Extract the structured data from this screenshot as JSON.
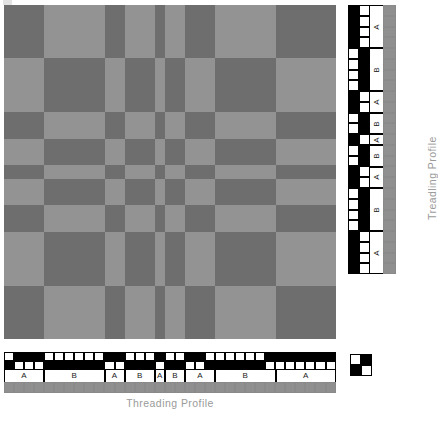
{
  "document": {
    "type": "weaving-draft",
    "title": "Block profile draft"
  },
  "labels": {
    "threading_caption": "Threading Profile",
    "treadling_caption": "Treadling Profile",
    "block_a": "A",
    "block_b": "B"
  },
  "colors": {
    "warp_dark": "#6e6e6e",
    "warp_light": "#939393",
    "profile_on": "#000000",
    "profile_off": "#ffffff",
    "color_bar": "#8f8f8f",
    "caption_text": "#9a9a9a",
    "grid_line": "#000000"
  },
  "threading": {
    "units": 33,
    "shafts": 2,
    "blocks": [
      {
        "label": "A",
        "shaft": 1,
        "units": 4
      },
      {
        "label": "B",
        "shaft": 2,
        "units": 6
      },
      {
        "label": "A",
        "shaft": 1,
        "units": 2
      },
      {
        "label": "B",
        "shaft": 2,
        "units": 3
      },
      {
        "label": "A",
        "shaft": 1,
        "units": 1
      },
      {
        "label": "B",
        "shaft": 2,
        "units": 2
      },
      {
        "label": "A",
        "shaft": 1,
        "units": 3
      },
      {
        "label": "B",
        "shaft": 2,
        "units": 6
      },
      {
        "label": "A",
        "shaft": 1,
        "units": 6
      }
    ],
    "shaft_rows": [
      [
        0,
        1,
        1,
        1,
        0,
        0,
        0,
        0,
        0,
        0,
        1,
        1,
        0,
        0,
        0,
        1,
        0,
        0,
        1,
        1,
        0,
        0,
        0,
        0,
        0,
        0,
        1,
        1,
        1,
        1,
        1,
        1,
        1
      ],
      [
        1,
        0,
        0,
        0,
        1,
        1,
        1,
        1,
        1,
        1,
        0,
        0,
        1,
        1,
        1,
        0,
        1,
        1,
        0,
        0,
        1,
        1,
        1,
        1,
        1,
        1,
        0,
        0,
        0,
        0,
        0,
        0,
        0
      ]
    ],
    "color_row": [
      "#8f8f8f",
      "#8f8f8f",
      "#8f8f8f",
      "#8f8f8f",
      "#8f8f8f",
      "#8f8f8f",
      "#8f8f8f",
      "#8f8f8f",
      "#8f8f8f",
      "#8f8f8f",
      "#8f8f8f",
      "#8f8f8f",
      "#8f8f8f",
      "#8f8f8f",
      "#8f8f8f",
      "#8f8f8f",
      "#8f8f8f",
      "#8f8f8f",
      "#8f8f8f",
      "#8f8f8f",
      "#8f8f8f",
      "#8f8f8f",
      "#8f8f8f",
      "#8f8f8f",
      "#8f8f8f",
      "#8f8f8f",
      "#8f8f8f",
      "#8f8f8f",
      "#8f8f8f",
      "#8f8f8f",
      "#8f8f8f",
      "#8f8f8f",
      "#8f8f8f"
    ]
  },
  "treadling": {
    "units": 31,
    "treadles": 2,
    "blocks": [
      {
        "label": "A",
        "treadle": 1,
        "units": 4
      },
      {
        "label": "B",
        "treadle": 2,
        "units": 4
      },
      {
        "label": "A",
        "treadle": 1,
        "units": 2
      },
      {
        "label": "B",
        "treadle": 2,
        "units": 2
      },
      {
        "label": "A",
        "treadle": 1,
        "units": 1
      },
      {
        "label": "B",
        "treadle": 2,
        "units": 2
      },
      {
        "label": "A",
        "treadle": 1,
        "units": 2
      },
      {
        "label": "B",
        "treadle": 2,
        "units": 4
      },
      {
        "label": "A",
        "treadle": 1,
        "units": 4
      }
    ],
    "treadle_cols": [
      [
        1,
        1,
        1,
        1,
        0,
        0,
        0,
        0,
        1,
        1,
        0,
        0,
        1,
        0,
        0,
        1,
        1,
        0,
        0,
        0,
        0,
        1,
        1,
        1,
        1
      ],
      [
        0,
        0,
        0,
        0,
        1,
        1,
        1,
        1,
        0,
        0,
        1,
        1,
        0,
        1,
        1,
        0,
        0,
        1,
        1,
        1,
        1,
        0,
        0,
        0,
        0
      ]
    ],
    "color_col": [
      "#8f8f8f",
      "#8f8f8f",
      "#8f8f8f",
      "#8f8f8f",
      "#8f8f8f",
      "#8f8f8f",
      "#8f8f8f",
      "#8f8f8f",
      "#8f8f8f",
      "#8f8f8f",
      "#8f8f8f",
      "#8f8f8f",
      "#8f8f8f",
      "#8f8f8f",
      "#8f8f8f",
      "#8f8f8f",
      "#8f8f8f",
      "#8f8f8f",
      "#8f8f8f",
      "#8f8f8f",
      "#8f8f8f",
      "#8f8f8f",
      "#8f8f8f",
      "#8f8f8f",
      "#8f8f8f"
    ]
  },
  "tieup": {
    "rows": 2,
    "cols": 2,
    "cells": [
      [
        0,
        1
      ],
      [
        1,
        0
      ]
    ]
  },
  "drawdown": {
    "note": "Block checkerboard: A-warp over B-weft dark, matching blocks light.",
    "col_blocks": [
      {
        "label": "A",
        "units": 4
      },
      {
        "label": "B",
        "units": 6
      },
      {
        "label": "A",
        "units": 2
      },
      {
        "label": "B",
        "units": 3
      },
      {
        "label": "A",
        "units": 1
      },
      {
        "label": "B",
        "units": 2
      },
      {
        "label": "A",
        "units": 3
      },
      {
        "label": "B",
        "units": 6
      },
      {
        "label": "A",
        "units": 6
      }
    ],
    "row_blocks": [
      {
        "label": "A",
        "units": 4
      },
      {
        "label": "B",
        "units": 4
      },
      {
        "label": "A",
        "units": 2
      },
      {
        "label": "B",
        "units": 2
      },
      {
        "label": "A",
        "units": 1
      },
      {
        "label": "B",
        "units": 2
      },
      {
        "label": "A",
        "units": 2
      },
      {
        "label": "B",
        "units": 4
      },
      {
        "label": "A",
        "units": 4
      }
    ]
  }
}
